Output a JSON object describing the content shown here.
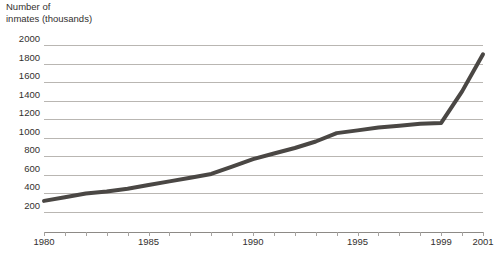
{
  "chart_data": {
    "type": "line",
    "title": "Number of\ninmates (thousands)",
    "xlabel": "",
    "ylabel": "Number of inmates (thousands)",
    "xlim": [
      1980,
      2001
    ],
    "ylim": [
      0,
      2000
    ],
    "yticks": [
      2000,
      1800,
      1600,
      1400,
      1200,
      1000,
      800,
      600,
      400,
      200
    ],
    "xticks": [
      1980,
      1981,
      1982,
      1983,
      1984,
      1985,
      1986,
      1987,
      1988,
      1989,
      1990,
      1991,
      1992,
      1993,
      1994,
      1995,
      1996,
      1997,
      1998,
      1999,
      2000,
      2001
    ],
    "xtick_labels": [
      "1980",
      "1985",
      "1990",
      "1995",
      "1999",
      "2001"
    ],
    "xtick_labeled_years": [
      1980,
      1985,
      1990,
      1995,
      1999,
      2001
    ],
    "grid": true,
    "legend": "none",
    "series": [
      {
        "name": "Number of inmates",
        "color": "#4a4744",
        "x": [
          1980,
          1981,
          1982,
          1983,
          1984,
          1985,
          1986,
          1987,
          1988,
          1989,
          1990,
          1991,
          1992,
          1993,
          1994,
          1995,
          1996,
          1997,
          1998,
          1999,
          2000,
          2001
        ],
        "values": [
          320,
          360,
          400,
          420,
          450,
          490,
          530,
          570,
          610,
          690,
          770,
          830,
          890,
          960,
          1050,
          1080,
          1110,
          1130,
          1150,
          1160,
          1500,
          1900
        ]
      }
    ]
  },
  "axis": {
    "title_text": "Number of\ninmates (thousands)",
    "y_labels": [
      "2000",
      "1800",
      "1600",
      "1400",
      "1200",
      "1000",
      "800",
      "600",
      "400",
      "200"
    ],
    "x_labels": [
      "1980",
      "1985",
      "1990",
      "1995",
      "1999",
      "2001"
    ]
  },
  "colors": {
    "line": "#4a4744",
    "gridline": "#b9b6b2",
    "axis": "#8d8a86",
    "text": "#33302e",
    "background": "#ffffff"
  }
}
